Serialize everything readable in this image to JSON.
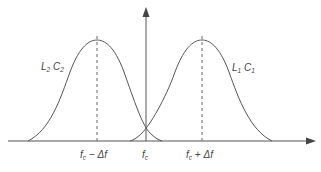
{
  "diagram": {
    "colors": {
      "line": "#555555",
      "background": "#ffffff"
    },
    "axes": {
      "x_arrow": true,
      "y_arrow": true
    },
    "curves": [
      {
        "label_main1": "L",
        "label_sub1": "2",
        "label_main2": "C",
        "label_sub2": "2",
        "center_label": "f_c − Δf"
      },
      {
        "label_main1": "L",
        "label_sub1": "1",
        "label_main2": "C",
        "label_sub2": "1",
        "center_label": "f_c + Δf"
      }
    ],
    "ticks": {
      "left": {
        "f": "f",
        "sub": "c",
        "rest": " − Δf"
      },
      "center": {
        "f": "f",
        "sub": "c"
      },
      "right": {
        "f": "f",
        "sub": "c",
        "rest": " + Δf"
      }
    }
  }
}
